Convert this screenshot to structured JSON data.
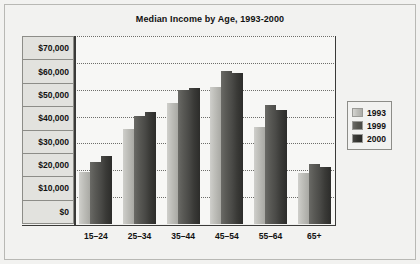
{
  "chart_data": {
    "type": "bar",
    "title": "Median Income by Age, 1993-2000",
    "xlabel": "",
    "ylabel": "",
    "categories": [
      "15–24",
      "25–34",
      "35–44",
      "45–54",
      "55–64",
      "65+"
    ],
    "series": [
      {
        "name": "1993",
        "color": "#bdbdb8",
        "values": [
          19500,
          35200,
          45000,
          51000,
          36200,
          19000
        ]
      },
      {
        "name": "1999",
        "color": "#56564f",
        "values": [
          23200,
          40100,
          49800,
          56800,
          44200,
          22200
        ]
      },
      {
        "name": "2000",
        "color": "#34342f",
        "values": [
          25200,
          41800,
          50600,
          56200,
          42500,
          21300
        ]
      }
    ],
    "ylim": [
      0,
      70000
    ],
    "ytick_values": [
      70000,
      60000,
      50000,
      40000,
      30000,
      20000,
      10000,
      0
    ],
    "ytick_labels": [
      "$70,000",
      "$60,000",
      "$50,000",
      "$40,000",
      "$30,000",
      "$20,000",
      "$10,000",
      "$0"
    ],
    "grid": true,
    "gridline_style": "dotted",
    "legend_position": "right",
    "legend_entries": [
      "1993",
      "1999",
      "2000"
    ]
  },
  "colors": {
    "figure_background": "#f2f2f0",
    "plot_background": "#f7f7f5",
    "axis": "#3a3a38",
    "gridline": "#6e6e6a",
    "label_box": "#e2e2de",
    "border": "#8d8d88",
    "text": "#111111"
  }
}
